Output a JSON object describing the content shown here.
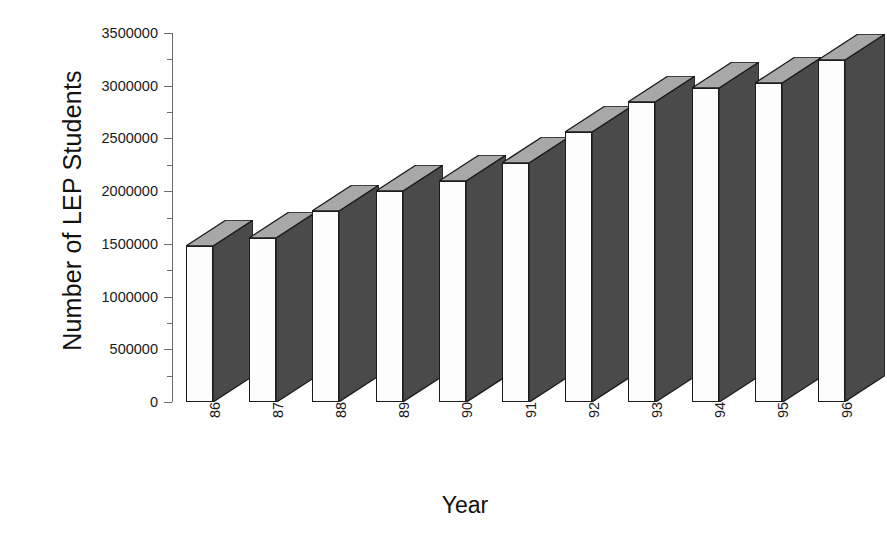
{
  "chart_data": {
    "type": "bar",
    "title": "",
    "subtitle": "",
    "xlabel": "Year",
    "ylabel": "Number of LEP Students",
    "categories": [
      "86-87",
      "87-88",
      "88-89",
      "89-90",
      "90-91",
      "91-92",
      "92-93",
      "93-94",
      "94-95",
      "95-96",
      "96-97"
    ],
    "values": [
      1480000,
      1560000,
      1810000,
      2000000,
      2100000,
      2270000,
      2560000,
      2850000,
      2980000,
      3030000,
      3240000
    ],
    "series": [
      {
        "name": "Number of LEP Students",
        "values": [
          1480000,
          1560000,
          1810000,
          2000000,
          2100000,
          2270000,
          2560000,
          2850000,
          2980000,
          3030000,
          3240000
        ]
      }
    ],
    "ylim": [
      0,
      3500000
    ],
    "ytick_labels": [
      "3500000",
      "3000000",
      "2500000",
      "2000000",
      "1500000",
      "1000000",
      "500000",
      "0"
    ],
    "ytick_values": [
      3500000,
      3000000,
      2500000,
      2000000,
      1500000,
      1000000,
      500000,
      0
    ],
    "grid": false,
    "legend": "none",
    "style": "3d-bar",
    "bar_face_color": "#fdfdfd",
    "bar_side_color": "#4a4a4a",
    "bar_top_color": "#a8a8a8",
    "bar_edge_color": "#1c1c1c",
    "axis_color": "#6d6d6d",
    "background_color": "#ffffff"
  },
  "axis": {
    "y_title": "Number of LEP Students",
    "x_title": "Year"
  }
}
